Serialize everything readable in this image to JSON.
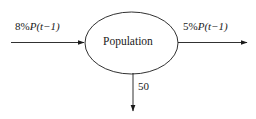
{
  "diagram": {
    "type": "stock-and-flow",
    "node": {
      "shape": "ellipse",
      "label": "Population"
    },
    "flows": [
      {
        "id": "inflow-left",
        "direction": "right",
        "role": "inflow",
        "label": "8%P(t−1)",
        "label_parts": {
          "rate": "8%",
          "variable": "P",
          "argument": "(t−1)"
        }
      },
      {
        "id": "outflow-right",
        "direction": "right",
        "role": "outflow",
        "label": "5%P(t−1)",
        "label_parts": {
          "rate": "5%",
          "variable": "P",
          "argument": "(t−1)"
        }
      },
      {
        "id": "outflow-down",
        "direction": "down",
        "role": "outflow",
        "label": "50",
        "label_parts": {
          "rate": "50",
          "variable": "",
          "argument": ""
        }
      }
    ],
    "colors": {
      "stroke": "#1a1a1a",
      "text": "#1a1a1a",
      "background": "#ffffff"
    }
  }
}
